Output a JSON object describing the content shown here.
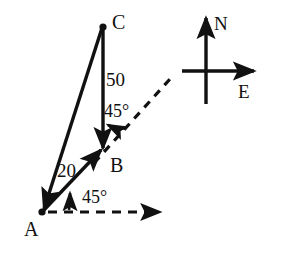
{
  "figure": {
    "type": "vector-diagram",
    "background_color": "#ffffff",
    "stroke_color": "#111111"
  },
  "vertices": [
    {
      "name": "A",
      "label": "A",
      "x": 42,
      "y": 212,
      "dot": true,
      "label_x": 24,
      "label_y": 219
    },
    {
      "name": "B",
      "label": "B",
      "x": 103,
      "y": 152,
      "dot": false,
      "label_x": 110,
      "label_y": 155
    },
    {
      "name": "C",
      "label": "C",
      "x": 103,
      "y": 27,
      "dot": true,
      "label_x": 112,
      "label_y": 12
    }
  ],
  "segments": [
    {
      "name": "A-to-B",
      "from": "A",
      "to": "B",
      "style": "solid",
      "arrowhead": "at-end",
      "magnitude_label": ""
    },
    {
      "name": "B-to-C",
      "from": "B",
      "to": "C",
      "style": "solid",
      "arrowhead": "at-start",
      "magnitude_label": "50"
    },
    {
      "name": "A-to-C",
      "from": "A",
      "to": "C",
      "style": "solid",
      "arrowhead": "at-start",
      "magnitude_label": "20"
    }
  ],
  "magnitudes": [
    {
      "name": "segment-bc-magnitude",
      "text": "50",
      "x": 106,
      "y": 70
    },
    {
      "name": "segment-ac-magnitude",
      "text": "20",
      "x": 57,
      "y": 161
    }
  ],
  "angles": [
    {
      "name": "angle-at-a",
      "text": "45°",
      "x": 82,
      "y": 188,
      "vertex": "A",
      "between": "east-reference and A-to-B"
    },
    {
      "name": "angle-at-b",
      "text": "45°",
      "x": 104,
      "y": 102,
      "vertex": "B",
      "between": "northeast-reference and B-to-C"
    }
  ],
  "reference_rays": [
    {
      "name": "east-reference-ray-at-a",
      "style": "dashed",
      "from_x": 42,
      "from_y": 212,
      "to_x": 167,
      "to_y": 212,
      "arrowhead": true
    },
    {
      "name": "northeast-reference-ray-at-b",
      "style": "dashed",
      "from_x": 94,
      "from_y": 163,
      "to_x": 170,
      "to_y": 79,
      "arrowhead": false
    }
  ],
  "compass": {
    "name": "compass-rose",
    "center_x": 206,
    "center_y": 71,
    "north": {
      "label": "N",
      "label_x": 214,
      "label_y": 14,
      "tip_x": 206,
      "tip_y": 13,
      "tail_x": 206,
      "tail_y": 104
    },
    "east": {
      "label": "E",
      "label_x": 238,
      "label_y": 82,
      "tip_x": 259,
      "tip_y": 71,
      "tail_x": 182,
      "tail_y": 71
    }
  }
}
